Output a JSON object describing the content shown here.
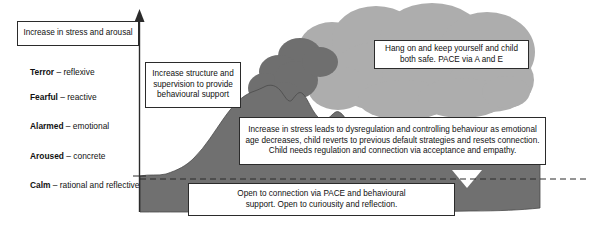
{
  "diagram": {
    "colors": {
      "cloud_light": "#adadad",
      "smoke_dark": "#6f6f6f",
      "landscape_dark": "#707070",
      "outline": "#2b2b2b",
      "text": "#111111",
      "background": "#ffffff"
    }
  },
  "axis": {
    "label": "Increase in stress and arousal",
    "direction": "up",
    "icon": "up-arrow-icon"
  },
  "states": [
    {
      "name": "Terror",
      "dash": "–",
      "descriptor": "reflexive"
    },
    {
      "name": "Fearful",
      "dash": "–",
      "descriptor": "reactive"
    },
    {
      "name": "Alarmed",
      "dash": "–",
      "descriptor": "emotional"
    },
    {
      "name": "Aroused",
      "dash": "–",
      "descriptor": "concrete"
    },
    {
      "name": "Calm",
      "dash": "–",
      "descriptor": "rational and reflective"
    }
  ],
  "callouts": {
    "structure": {
      "lines": [
        "Increase structure and",
        "supervision to provide",
        "behavioural support"
      ]
    },
    "hang_on": {
      "lines": [
        "Hang on and keep yourself and child",
        "both safe. PACE via A and E"
      ]
    },
    "dysregulation": {
      "lines": [
        "Increase in stress leads to dysregulation and controlling behaviour as emotional",
        "age decreases, child reverts to previous default strategies and resets connection.",
        "Child needs regulation and connection via acceptance and empathy."
      ]
    },
    "open_connection": {
      "lines": [
        "Open to connection via PACE and behavioural",
        "support. Open to curiousity and reflection."
      ]
    }
  }
}
